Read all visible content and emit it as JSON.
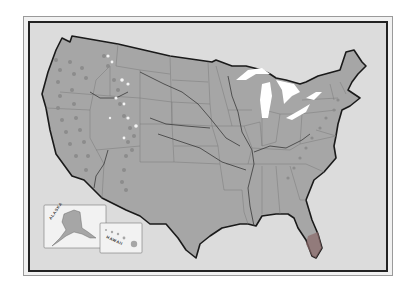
{
  "map": {
    "title": "",
    "region": "United States",
    "colors": {
      "background": "#ffffff",
      "frame": "#dcdcdc",
      "land": "#a6a6a6",
      "state_border": "#7a7a7a",
      "coast_border": "#1a1a1a",
      "river": "#3a3a3a",
      "lakes": "#ffffff",
      "mountains": "#8c8c8c",
      "snow_peaks": "#f5f5f5",
      "south_florida": "#8a6a6a"
    },
    "features": {
      "mountain_ranges": [
        "Cascades/Sierra Nevada",
        "Rocky Mountains",
        "Appalachians"
      ],
      "lakes": [
        "Great Lakes"
      ],
      "rivers": [
        "Mississippi",
        "Missouri",
        "Ohio",
        "Snake",
        "Colorado",
        "Arkansas",
        "Platte"
      ]
    },
    "insets": [
      {
        "name": "alaska",
        "label": "ALASKA"
      },
      {
        "name": "hawaii",
        "label": "HAWAII"
      }
    ]
  }
}
